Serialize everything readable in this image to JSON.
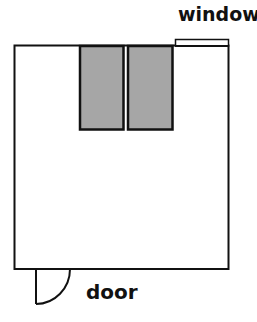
{
  "diagram": {
    "type": "floor-plan",
    "labels": {
      "window": "window",
      "door": "door"
    },
    "colors": {
      "wall": "#111111",
      "furniture_fill": "#a6a6a6",
      "background": "#ffffff"
    },
    "elements": [
      {
        "kind": "room",
        "label": "",
        "x": 14,
        "y": 45,
        "w": 215,
        "h": 224
      },
      {
        "kind": "window",
        "label": "window",
        "x": 175,
        "y": 39,
        "w": 54,
        "h": 7
      },
      {
        "kind": "furniture",
        "label": "",
        "x": 79,
        "y": 45,
        "w": 45,
        "h": 85
      },
      {
        "kind": "furniture",
        "label": "",
        "x": 127,
        "y": 45,
        "w": 46,
        "h": 85
      },
      {
        "kind": "door",
        "label": "door",
        "hinge_x": 36,
        "hinge_y": 269,
        "radius": 34
      }
    ]
  }
}
